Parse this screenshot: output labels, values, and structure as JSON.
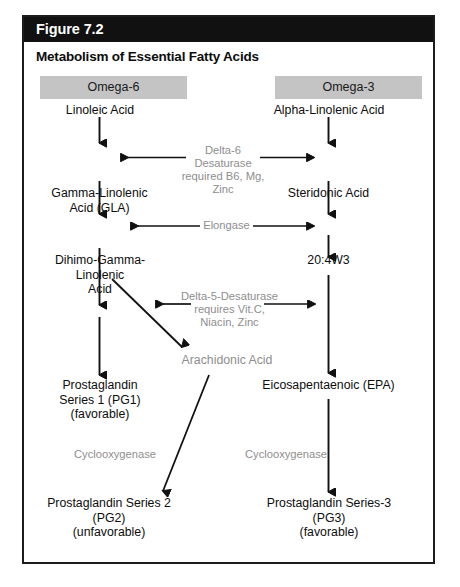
{
  "figure": {
    "label": "Figure 7.2",
    "title": "Metabolism of Essential Fatty Acids"
  },
  "columns": {
    "left_banner": "Omega-6",
    "right_banner": "Omega-3"
  },
  "colors": {
    "header_bar": "#111111",
    "header_text": "#ffffff",
    "banner_fill": "#c4c4c4",
    "body_text": "#0d0d0d",
    "enzyme_text": "#8e8e8e",
    "arrow": "#111111",
    "frame": "#1c1c1c",
    "page_background": "#ffffff"
  },
  "nodes": {
    "linoleic_acid": "Linoleic Acid",
    "alpha_linolenic_acid": "Alpha-Linolenic Acid",
    "gamma_linolenic_acid": "Gamma-Linolenic\nAcid (GLA)",
    "steridonic_acid": "Steridonic Acid",
    "dihomo_gamma_linolenic_acid": "Dihimo-Gamma-\nLinolenic\nAcid",
    "twenty_four_w3": "20:4W3",
    "arachidonic_acid": "Arachidonic Acid",
    "prostaglandin_1": "Prostaglandin\nSeries 1 (PG1)\n(favorable)",
    "eicosapentaenoic": "Eicosapentaenoic (EPA)",
    "prostaglandin_2": "Prostaglandin Series 2\n(PG2)\n(unfavorable)",
    "prostaglandin_3": "Prostaglandin Series-3\n(PG3)\n(favorable)"
  },
  "enzymes": {
    "delta6_desaturase": "Delta-6 Desaturase\nrequired B6, Mg, Zinc",
    "elongase": "Elongase",
    "delta5_desaturase": "Delta-5-Desaturase\nrequires Vit.C,\nNiacin, Zinc",
    "cyclooxygenase_left": "Cyclooxygenase",
    "cyclooxygenase_right": "Cyclooxygenase"
  }
}
